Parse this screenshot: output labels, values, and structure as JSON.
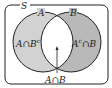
{
  "diagram": {
    "type": "venn",
    "universe_label": "S",
    "sets": [
      {
        "name": "A",
        "label": "A"
      },
      {
        "name": "B",
        "label": "B"
      }
    ],
    "regions": {
      "a_only": "A∩B",
      "a_only_sup": "c",
      "b_only_pre": "A",
      "b_only_sup": "c",
      "b_only_post": "∩B",
      "intersection": "A∩B"
    },
    "colors": {
      "a_only": "#d2d2d2",
      "b_only": "#b9b9b9",
      "intersection": "#ffffff",
      "stroke": "#222222"
    }
  }
}
